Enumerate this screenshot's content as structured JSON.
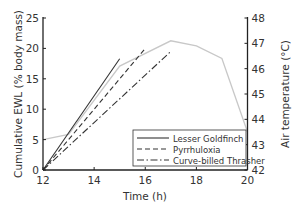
{
  "chart_data": {
    "type": "line",
    "title": "",
    "xlabel": "Time (h)",
    "ylabel": "Cumulative EWL (% body mass)",
    "ylabel_right": "Air temperature (°C)",
    "xlim": [
      12,
      20
    ],
    "ylim": [
      0,
      25
    ],
    "ylim_right": [
      42,
      48
    ],
    "x_ticks": [
      12,
      14,
      16,
      18,
      20
    ],
    "y_ticks": [
      0,
      5,
      10,
      15,
      20,
      25
    ],
    "y_ticks_right": [
      42,
      43,
      44,
      45,
      46,
      47,
      48
    ],
    "grid": false,
    "legend_position": "lower right",
    "series": [
      {
        "name": "Lesser Goldfinch",
        "style": "solid",
        "axis": "left",
        "color": "#333333",
        "x": [
          12,
          15
        ],
        "values": [
          0,
          18.3
        ]
      },
      {
        "name": "Pyrrhuloxia",
        "style": "dashed",
        "axis": "left",
        "color": "#333333",
        "x": [
          12,
          16
        ],
        "values": [
          0,
          20.0
        ]
      },
      {
        "name": "Curve-billed Thrasher",
        "style": "dashdot",
        "axis": "left",
        "color": "#333333",
        "x": [
          12,
          17
        ],
        "values": [
          0,
          19.5
        ]
      },
      {
        "name": "Air temperature",
        "style": "solid",
        "axis": "right",
        "color": "#c8c8c8",
        "in_legend": false,
        "x": [
          12,
          13,
          15,
          17,
          18,
          19,
          20
        ],
        "values": [
          43.2,
          43.4,
          46.1,
          47.1,
          46.9,
          46.4,
          43.5
        ]
      }
    ]
  },
  "labels": {
    "xlabel": "Time (h)",
    "ylabel": "Cumulative EWL (% body mass)",
    "ylabel_right": "Air temperature (°C)",
    "legend": [
      "Lesser Goldfinch",
      "Pyrrhuloxia",
      "Curve-billed Thrasher"
    ]
  }
}
